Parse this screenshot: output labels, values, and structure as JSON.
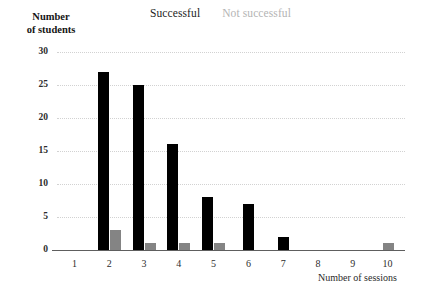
{
  "legend": {
    "successful_label": "Successful",
    "unsuccessful_label": "Not successful",
    "successful_color": "#000000",
    "unsuccessful_color": "#848484"
  },
  "axes": {
    "y_title_line1": "Number",
    "y_title_line2": "of students",
    "x_title": "Number of sessions",
    "y_ticks": [
      "30",
      "25",
      "20",
      "15",
      "10",
      "5",
      "0"
    ],
    "x_ticks": [
      "1",
      "2",
      "3",
      "4",
      "5",
      "6",
      "7",
      "8",
      "9",
      "10"
    ]
  },
  "chart_data": {
    "type": "bar",
    "title": "",
    "xlabel": "Number of sessions",
    "ylabel": "Number of students",
    "categories": [
      "1",
      "2",
      "3",
      "4",
      "5",
      "6",
      "7",
      "8",
      "9",
      "10"
    ],
    "series": [
      {
        "name": "Successful",
        "color": "#000000",
        "values": [
          0,
          27,
          25,
          16,
          8,
          7,
          2,
          0,
          0,
          0
        ]
      },
      {
        "name": "Not successful",
        "color": "#848484",
        "values": [
          0,
          3,
          1,
          1,
          1,
          0,
          0,
          0,
          0,
          1
        ]
      }
    ],
    "ylim": [
      0,
      30
    ],
    "ytick_step": 5,
    "grid": true,
    "grid_style": "dotted-horizontal",
    "legend_position": "top-center"
  }
}
